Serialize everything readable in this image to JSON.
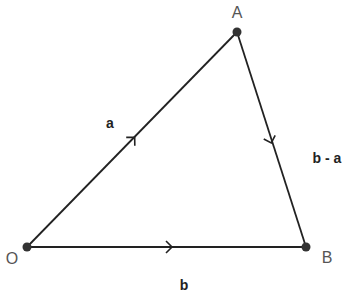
{
  "diagram": {
    "type": "vector-triangle",
    "colors": {
      "line": "#222222",
      "point": "#333333",
      "point_label": "#555555",
      "vector_label": "#222222",
      "background": "#ffffff"
    },
    "points": [
      {
        "id": "O",
        "label": "O",
        "x": 27,
        "y": 247,
        "label_x": 12,
        "label_y": 264
      },
      {
        "id": "A",
        "label": "A",
        "x": 237,
        "y": 32,
        "label_x": 237,
        "label_y": 18
      },
      {
        "id": "B",
        "label": "B",
        "x": 306,
        "y": 247,
        "label_x": 327,
        "label_y": 263
      }
    ],
    "vectors": [
      {
        "id": "OA",
        "from": "O",
        "to": "A",
        "label": "a",
        "label_x": 110,
        "label_y": 128
      },
      {
        "id": "AB",
        "from": "A",
        "to": "B",
        "label": "b - a",
        "label_x": 327,
        "label_y": 163
      },
      {
        "id": "OB",
        "from": "O",
        "to": "B",
        "label": "b",
        "label_x": 184,
        "label_y": 290
      }
    ]
  }
}
